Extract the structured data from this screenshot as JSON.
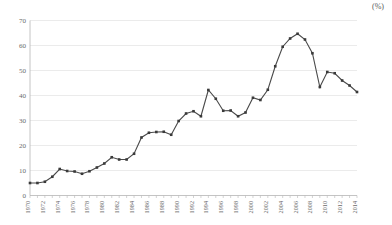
{
  "unit_label": "(%)",
  "chart_data": {
    "type": "line",
    "title": "",
    "xlabel": "",
    "ylabel": "",
    "unit": "(%)",
    "ylim": [
      0,
      70
    ],
    "ytick_step": 10,
    "yticks": [
      0,
      10,
      20,
      30,
      40,
      50,
      60,
      70
    ],
    "grid": true,
    "legend": "none",
    "marker": "square",
    "xtick_label_interval": 2,
    "x": [
      1970,
      1971,
      1972,
      1973,
      1974,
      1975,
      1976,
      1977,
      1978,
      1979,
      1980,
      1981,
      1982,
      1983,
      1984,
      1985,
      1986,
      1987,
      1988,
      1989,
      1990,
      1991,
      1992,
      1993,
      1994,
      1995,
      1996,
      1997,
      1998,
      1999,
      2000,
      2001,
      2002,
      2003,
      2004,
      2005,
      2006,
      2007,
      2008,
      2009,
      2010,
      2011,
      2012,
      2013,
      2014
    ],
    "xtick_labels": [
      "1970",
      "1972",
      "1974",
      "1976",
      "1978",
      "1980",
      "1982",
      "1984",
      "1986",
      "1988",
      "1990",
      "1992",
      "1994",
      "1996",
      "1998",
      "2000",
      "2002",
      "2004",
      "2006",
      "2008",
      "2010",
      "2012",
      "2014"
    ],
    "values": [
      5.0,
      5.0,
      5.5,
      7.5,
      10.6,
      9.8,
      9.6,
      8.7,
      9.7,
      11.2,
      12.8,
      15.3,
      14.4,
      14.4,
      16.7,
      23.2,
      25.1,
      25.4,
      25.5,
      24.3,
      29.8,
      32.8,
      33.7,
      31.7,
      42.2,
      38.7,
      33.9,
      34.0,
      31.7,
      33.2,
      39.1,
      38.2,
      42.3,
      51.7,
      59.5,
      62.8,
      64.7,
      62.4,
      56.9,
      43.4,
      49.4,
      48.9,
      46.0,
      44.0,
      41.4
    ],
    "series": [
      {
        "name": "series-1",
        "values": [
          5.0,
          5.0,
          5.5,
          7.5,
          10.6,
          9.8,
          9.6,
          8.7,
          9.7,
          11.2,
          12.8,
          15.3,
          14.4,
          14.4,
          16.7,
          23.2,
          25.1,
          25.4,
          25.5,
          24.3,
          29.8,
          32.8,
          33.7,
          31.7,
          42.2,
          38.7,
          33.9,
          34.0,
          31.7,
          33.2,
          39.1,
          38.2,
          42.3,
          51.7,
          59.5,
          62.8,
          64.7,
          62.4,
          56.9,
          43.4,
          49.4,
          48.9,
          46.0,
          44.0,
          41.4
        ]
      }
    ]
  }
}
